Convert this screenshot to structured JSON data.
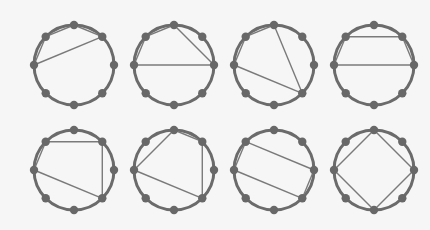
{
  "diagram": {
    "title": "",
    "colors": {
      "background": "#f6f6f6",
      "circle_stroke": "#6b6b6b",
      "node_fill": "#686868",
      "chord_stroke": "#7a7a7a"
    },
    "node_count": 8,
    "node_order": [
      "top",
      "top-right",
      "right",
      "bottom-right",
      "bottom",
      "bottom-left",
      "left",
      "top-left"
    ],
    "radius": 40,
    "circles": [
      {
        "id": "circle-1",
        "cx": 74,
        "cy": 65,
        "chords": [
          [
            6,
            7
          ],
          [
            7,
            0
          ],
          [
            0,
            1
          ],
          [
            1,
            6
          ]
        ]
      },
      {
        "id": "circle-2",
        "cx": 174,
        "cy": 65,
        "chords": [
          [
            6,
            7
          ],
          [
            7,
            0
          ],
          [
            0,
            2
          ],
          [
            2,
            6
          ]
        ]
      },
      {
        "id": "circle-3",
        "cx": 274,
        "cy": 65,
        "chords": [
          [
            6,
            7
          ],
          [
            7,
            0
          ],
          [
            0,
            3
          ],
          [
            3,
            6
          ]
        ]
      },
      {
        "id": "circle-4",
        "cx": 374,
        "cy": 65,
        "chords": [
          [
            6,
            7
          ],
          [
            7,
            1
          ],
          [
            1,
            2
          ],
          [
            2,
            6
          ]
        ]
      },
      {
        "id": "circle-5",
        "cx": 74,
        "cy": 170,
        "chords": [
          [
            6,
            7
          ],
          [
            7,
            1
          ],
          [
            1,
            3
          ],
          [
            3,
            6
          ]
        ]
      },
      {
        "id": "circle-6",
        "cx": 174,
        "cy": 170,
        "chords": [
          [
            6,
            0
          ],
          [
            0,
            1
          ],
          [
            1,
            3
          ],
          [
            3,
            6
          ]
        ]
      },
      {
        "id": "circle-7",
        "cx": 274,
        "cy": 170,
        "chords": [
          [
            6,
            7
          ],
          [
            7,
            2
          ],
          [
            2,
            3
          ],
          [
            3,
            6
          ]
        ]
      },
      {
        "id": "circle-8",
        "cx": 374,
        "cy": 170,
        "chords": [
          [
            6,
            0
          ],
          [
            0,
            2
          ],
          [
            2,
            4
          ],
          [
            4,
            6
          ]
        ]
      }
    ]
  }
}
